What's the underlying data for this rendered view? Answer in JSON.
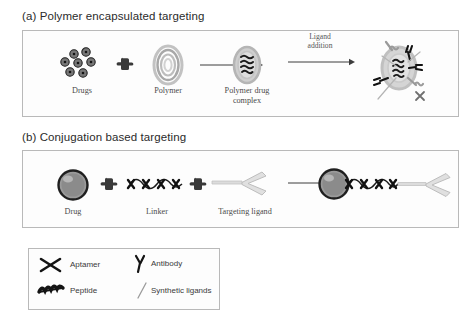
{
  "figure": {
    "background_color": "#ffffff",
    "border_color": "#b9b9b9"
  },
  "panels": [
    {
      "id": "a",
      "title": "(a) Polymer encapsulated targeting",
      "steps": [
        {
          "label": "Drugs",
          "icon": "drug-cluster-icon"
        },
        {
          "label": "+",
          "icon": "plus-cross-icon"
        },
        {
          "label": "Polymer",
          "icon": "polymer-rings-icon"
        },
        {
          "label": "",
          "icon": "arrow-right-icon"
        },
        {
          "label": "Polymer drug complex",
          "label_line1": "Polymer drug",
          "label_line2": "complex",
          "icon": "polymer-drug-complex-icon"
        },
        {
          "label": "Ligand addition",
          "label_line1": "Ligand",
          "label_line2": "addition",
          "icon": "arrow-right-icon"
        },
        {
          "label": "",
          "icon": "targeted-complex-icon"
        }
      ]
    },
    {
      "id": "b",
      "title": "(b) Conjugation based targeting",
      "steps": [
        {
          "label": "Drug",
          "icon": "drug-sphere-icon"
        },
        {
          "label": "+",
          "icon": "plus-cross-icon"
        },
        {
          "label": "Linker",
          "icon": "linker-chain-icon"
        },
        {
          "label": "+",
          "icon": "plus-cross-icon"
        },
        {
          "label": "Targeting ligand",
          "icon": "antibody-ligand-icon"
        },
        {
          "label": "",
          "icon": "arrow-right-icon"
        },
        {
          "label": "",
          "icon": "drug-conjugate-icon"
        }
      ]
    }
  ],
  "legend": {
    "items": [
      {
        "label": "Aptamer",
        "icon": "aptamer-x-icon"
      },
      {
        "label": "Antibody",
        "icon": "antibody-y-icon"
      },
      {
        "label": "Peptide",
        "icon": "peptide-squiggle-icon"
      },
      {
        "label": "Synthetic ligands",
        "icon": "synthetic-ligand-line-icon"
      }
    ]
  },
  "colors": {
    "ink": "#2b2b2b",
    "caption": "#4a4a4a",
    "border": "#b9b9b9",
    "drug_dark": "#2d2d2d",
    "polymer_gray": "#b0b0b0",
    "sphere_gray": "#8e8e8e",
    "ligand_light": "#d9d9d9"
  }
}
